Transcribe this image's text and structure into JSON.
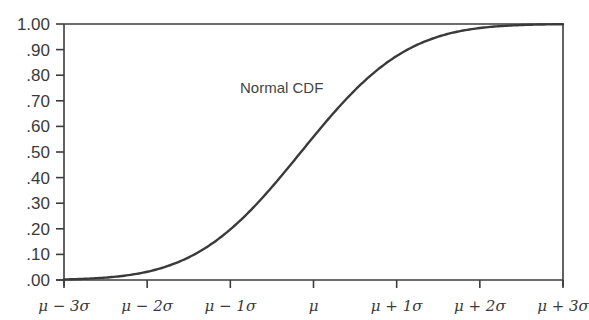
{
  "chart_data": {
    "type": "line",
    "title": "",
    "xlabel": "",
    "ylabel": "",
    "x_ticks": [
      "μ − 3σ",
      "μ − 2σ",
      "μ − 1σ",
      "μ",
      "μ + 1σ",
      "μ + 2σ",
      "μ + 3σ"
    ],
    "y_ticks": [
      "1.00",
      ".90",
      ".80",
      ".70",
      ".60",
      ".50",
      ".40",
      ".30",
      ".20",
      ".10",
      ".00"
    ],
    "ylim": [
      0,
      1
    ],
    "xlim": [
      -3,
      3
    ],
    "grid": false,
    "legend": null,
    "annotations": [
      {
        "text": "Normal CDF",
        "x": -0.4,
        "y": 0.72
      }
    ],
    "series": [
      {
        "name": "Normal CDF",
        "x": [
          -3,
          -2.5,
          -2,
          -1.5,
          -1,
          -0.5,
          0,
          0.5,
          1,
          1.5,
          2,
          2.5,
          3
        ],
        "values": [
          0.001,
          0.006,
          0.023,
          0.067,
          0.159,
          0.309,
          0.5,
          0.691,
          0.841,
          0.933,
          0.977,
          0.994,
          0.999
        ]
      }
    ]
  },
  "colors": {
    "axis": "#3c3c3c",
    "curve": "#3a3a3a",
    "text": "#3a3a3a",
    "background": "#ffffff"
  }
}
